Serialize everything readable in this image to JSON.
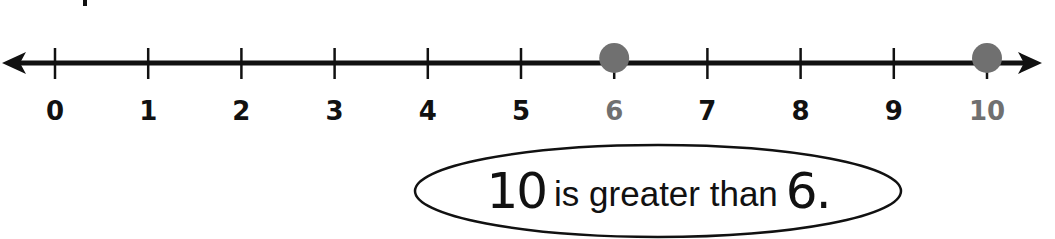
{
  "chart_data": {
    "type": "number_line",
    "min": 0,
    "max": 10,
    "ticks": [
      0,
      1,
      2,
      3,
      4,
      5,
      6,
      7,
      8,
      9,
      10
    ],
    "tick_labels": [
      "0",
      "1",
      "2",
      "3",
      "4",
      "5",
      "6",
      "7",
      "8",
      "9",
      "10"
    ],
    "highlighted_points": [
      6,
      10
    ],
    "highlight_color": "#707070",
    "arrows": "both",
    "annotation": "10 is greater than 6."
  },
  "caption": {
    "left_number": "10",
    "phrase": "is greater than",
    "right_number": "6."
  },
  "colors": {
    "line": "#111111",
    "highlight": "#707070",
    "background": "#ffffff"
  }
}
